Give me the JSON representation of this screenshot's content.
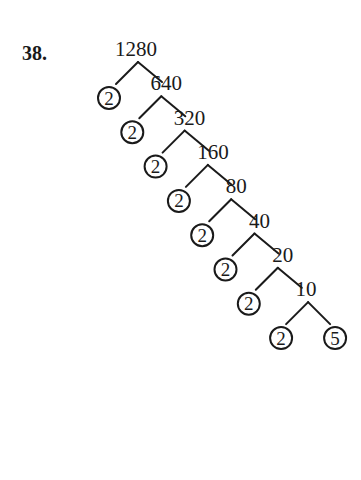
{
  "problem": {
    "number": "38."
  },
  "tree": {
    "root": "1280",
    "levels": [
      {
        "prime": "2",
        "composite": "640"
      },
      {
        "prime": "2",
        "composite": "320"
      },
      {
        "prime": "2",
        "composite": "160"
      },
      {
        "prime": "2",
        "composite": "80"
      },
      {
        "prime": "2",
        "composite": "40"
      },
      {
        "prime": "2",
        "composite": "20"
      },
      {
        "prime": "2",
        "composite": "10"
      }
    ],
    "final": {
      "left": "2",
      "right": "5"
    }
  }
}
